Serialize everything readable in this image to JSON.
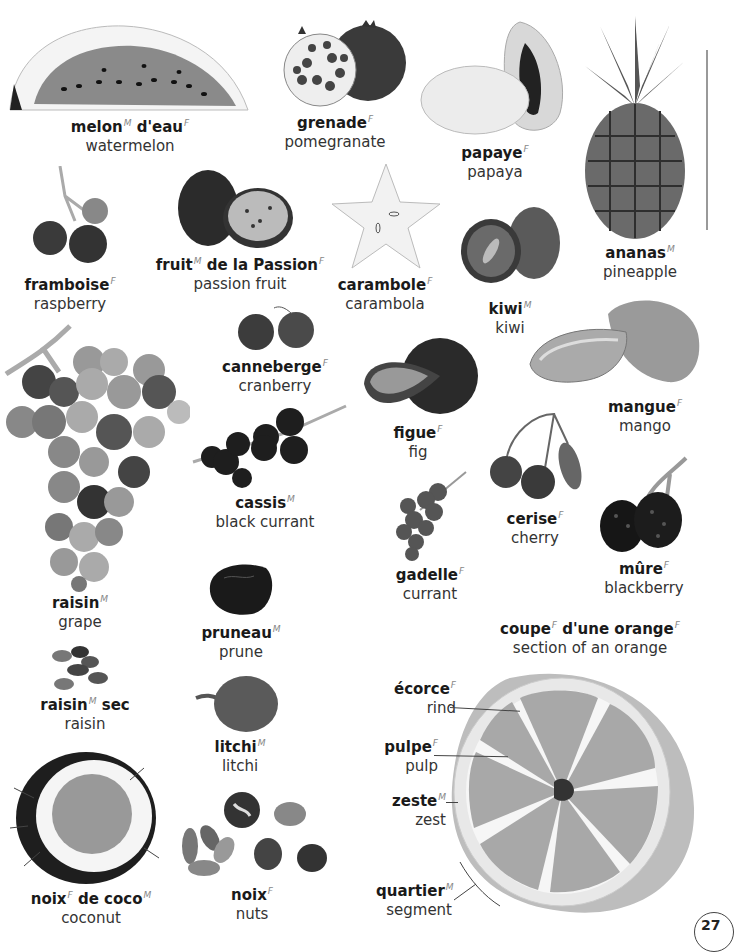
{
  "page": {
    "topic": "fruits",
    "page_number": "27"
  },
  "fruits": {
    "watermelon": {
      "fr": "melon",
      "fr_gender": "M",
      "fr2": "d'eau",
      "fr2_gender": "F",
      "en": "watermelon"
    },
    "pomegranate": {
      "fr": "grenade",
      "fr_gender": "F",
      "en": "pomegranate"
    },
    "papaya": {
      "fr": "papaye",
      "fr_gender": "F",
      "en": "papaya"
    },
    "pineapple": {
      "fr": "ananas",
      "fr_gender": "M",
      "en": "pineapple"
    },
    "raspberry": {
      "fr": "framboise",
      "fr_gender": "F",
      "en": "raspberry"
    },
    "passion_fruit": {
      "fr": "fruit",
      "fr_gender": "M",
      "fr2": "de la Passion",
      "fr2_gender": "F",
      "en": "passion fruit"
    },
    "carambola": {
      "fr": "carambole",
      "fr_gender": "F",
      "en": "carambola"
    },
    "kiwi": {
      "fr": "kiwi",
      "fr_gender": "M",
      "en": "kiwi"
    },
    "mango": {
      "fr": "mangue",
      "fr_gender": "F",
      "en": "mango"
    },
    "grape": {
      "fr": "raisin",
      "fr_gender": "M",
      "en": "grape"
    },
    "cranberry": {
      "fr": "canneberge",
      "fr_gender": "F",
      "en": "cranberry"
    },
    "fig": {
      "fr": "figue",
      "fr_gender": "F",
      "en": "fig"
    },
    "black_currant": {
      "fr": "cassis",
      "fr_gender": "M",
      "en": "black currant"
    },
    "cherry": {
      "fr": "cerise",
      "fr_gender": "F",
      "en": "cherry"
    },
    "currant": {
      "fr": "gadelle",
      "fr_gender": "F",
      "en": "currant"
    },
    "blackberry": {
      "fr": "mûre",
      "fr_gender": "F",
      "en": "blackberry"
    },
    "prune": {
      "fr": "pruneau",
      "fr_gender": "M",
      "en": "prune"
    },
    "raisin": {
      "fr": "raisin",
      "fr_gender": "M",
      "fr2": "sec",
      "en": "raisin"
    },
    "litchi": {
      "fr": "litchi",
      "fr_gender": "M",
      "en": "litchi"
    },
    "coconut": {
      "fr": "noix",
      "fr_gender": "F",
      "fr2": "de coco",
      "fr2_gender": "M",
      "en": "coconut"
    },
    "nuts": {
      "fr": "noix",
      "fr_gender": "F",
      "en": "nuts"
    }
  },
  "orange_section": {
    "title": {
      "fr": "coupe",
      "fr_gender": "F",
      "fr2": "d'une orange",
      "fr2_gender": "F",
      "en": "section of an orange"
    },
    "parts": [
      {
        "fr": "écorce",
        "fr_gender": "F",
        "en": "rind"
      },
      {
        "fr": "pulpe",
        "fr_gender": "F",
        "en": "pulp"
      },
      {
        "fr": "zeste",
        "fr_gender": "M",
        "en": "zest"
      },
      {
        "fr": "quartier",
        "fr_gender": "M",
        "en": "segment"
      }
    ]
  }
}
